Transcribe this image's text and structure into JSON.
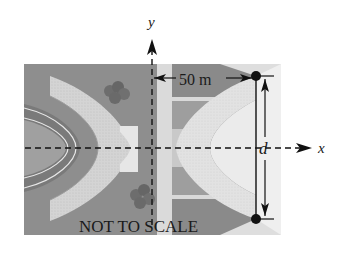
{
  "diagram": {
    "axes": {
      "x_label": "x",
      "y_label": "y"
    },
    "dimensions": {
      "horizontal_label": "50 m",
      "vertical_label": "d"
    },
    "note": "NOT TO SCALE",
    "colors": {
      "ground_dark": "#8a8a8a",
      "ground_mid": "#a6a6a6",
      "road_light": "#d9d9d9",
      "road_lighter": "#ececec",
      "inner_field": "#9a9a9a",
      "track_dark": "#6e6e6e",
      "bushes": "#6a6a6a",
      "ink": "#111111"
    }
  }
}
